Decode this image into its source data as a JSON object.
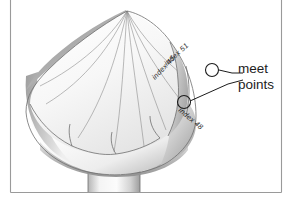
{
  "figure": {
    "background_color": "#ffffff",
    "frame_color": "#9a9a9a",
    "ink_color": "#1c1c1c"
  },
  "callouts": [
    {
      "name": "meet-points",
      "line1": "meet",
      "line2": "points"
    }
  ],
  "surface_labels": [
    {
      "name": "index-51",
      "text": "index 51"
    },
    {
      "name": "index-45",
      "text": "index 45"
    },
    {
      "name": "index-48",
      "text": "index 48"
    }
  ],
  "markers": [
    {
      "name": "meet-point-upper"
    },
    {
      "name": "meet-point-lower"
    }
  ],
  "shading": {
    "rim_dark": "#a8a8a8",
    "rim_mid": "#c9c9c9",
    "body_light": "#fdfdfd",
    "body_shadow": "#b4b4b4",
    "stem_shadow": "#9d9d9d"
  }
}
